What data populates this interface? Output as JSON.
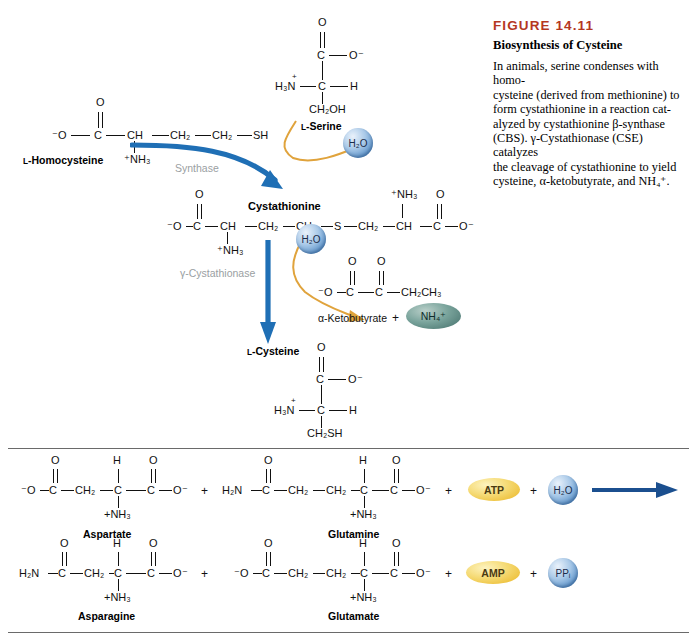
{
  "figure": {
    "number": "FIGURE 14.11",
    "title": "Biosynthesis of Cysteine",
    "body_line1": "In animals, serine condenses with homo-",
    "body_line2": "cysteine (derived from methionine) to",
    "body_line3": "form cystathionine in a reaction cat-",
    "body_line4": "alyzed by cystathionine β-synthase",
    "body_line5": "(CBS). γ-Cystathionase (CSE) catalyzes",
    "body_line6": "the cleavage of cystathionine to yield",
    "body_line7": "cysteine, α-ketobutyrate, and NH₄⁺.",
    "accent_color": "#b5371f"
  },
  "colors": {
    "blue_arrow": "#1f6fb5",
    "orange_arrow": "#e0a33c",
    "enzyme_label": "#9aa0a2",
    "water_bubble": "#5b92c9",
    "atp_oval": "#eec23f",
    "ammonium_oval": "#547f79",
    "rule": "#6a6a6a"
  },
  "panel_top": {
    "homocysteine": {
      "label": "L-Homocysteine",
      "label_smallcaps": "L",
      "label_rest": "-Homocysteine",
      "atoms": {
        "o_minus": "⁻O",
        "c": "C",
        "o_double": "O",
        "ch": "CH",
        "ch2_a": "CH₂",
        "ch2_b": "CH₂",
        "sh": "SH",
        "nh3": "⁺NH₃"
      }
    },
    "serine": {
      "label": "L-Serine",
      "label_smallcaps": "L",
      "label_rest": "-Serine",
      "atoms": {
        "o_double": "O",
        "c_top": "C",
        "o_minus": "O⁻",
        "h3n": "H₃N",
        "h3n_charge": "+",
        "c_alpha": "C",
        "h": "H",
        "ch2oh": "CH₂OH"
      }
    },
    "enzyme_synthase": "Synthase",
    "water_1": "H₂O",
    "cystathionine": {
      "label": "Cystathionine",
      "atoms": {
        "o_minus_left": "⁻O",
        "c_left": "C",
        "o_double_left": "O",
        "ch_left": "CH",
        "nh3_left": "⁺NH₃",
        "ch2_a": "CH₂",
        "ch2_b": "CH₂",
        "s": "S",
        "ch2_c": "CH₂",
        "ch_right": "CH",
        "nh3_right": "⁺NH₃",
        "c_right": "C",
        "o_double_right": "O",
        "o_minus_right": "O⁻"
      }
    },
    "enzyme_cystathionase": "γ-Cystathionase",
    "water_2": "H₂O",
    "ketobutyrate": {
      "label": "α-Ketobutyrate",
      "plus": "+",
      "ammonium": "NH₄⁺",
      "atoms": {
        "o_minus": "⁻O",
        "c1": "C",
        "o1": "O",
        "c2": "C",
        "o2": "O",
        "ch2ch3": "CH₂CH₃"
      }
    },
    "cysteine": {
      "label": "L-Cysteine",
      "label_smallcaps": "L",
      "label_rest": "-Cysteine",
      "atoms": {
        "o_double": "O",
        "c_top": "C",
        "o_minus": "O⁻",
        "h3n": "H₃N",
        "h3n_charge": "+",
        "c_alpha": "C",
        "h": "H",
        "ch2sh": "CH₂SH"
      }
    }
  },
  "panel_bottom": {
    "row1": {
      "aspartate": {
        "label": "Aspartate",
        "atoms": {
          "o_minus_left": "⁻O",
          "c1": "C",
          "o1": "O",
          "ch2": "CH₂",
          "c_alpha": "C",
          "h": "H",
          "nh3": "+NH₃",
          "c2": "C",
          "o2": "O",
          "o_minus_right": "O⁻"
        }
      },
      "plus_1": "+",
      "glutamine": {
        "label": "Glutamine",
        "atoms": {
          "h2n": "H₂N",
          "c1": "C",
          "o1": "O",
          "ch2_a": "CH₂",
          "ch2_b": "CH₂",
          "c_alpha": "C",
          "h": "H",
          "nh3": "+NH₃",
          "c2": "C",
          "o2": "O",
          "o_minus": "O⁻"
        }
      },
      "plus_2": "+",
      "atp": "ATP",
      "plus_3": "+",
      "water": "H₂O"
    },
    "row2": {
      "asparagine": {
        "label": "Asparagine",
        "atoms": {
          "h2n": "H₂N",
          "c1": "C",
          "o1": "O",
          "ch2": "CH₂",
          "c_alpha": "C",
          "h": "H",
          "nh3": "+NH₃",
          "c2": "C",
          "o2": "O",
          "o_minus": "O⁻"
        }
      },
      "plus_1": "+",
      "glutamate": {
        "label": "Glutamate",
        "atoms": {
          "o_minus_left": "⁻O",
          "c1": "C",
          "o1": "O",
          "ch2_a": "CH₂",
          "ch2_b": "CH₂",
          "c_alpha": "C",
          "h": "H",
          "nh3": "+NH₃",
          "c2": "C",
          "o2": "O",
          "o_minus_right": "O⁻"
        }
      },
      "plus_2": "+",
      "amp": "AMP",
      "plus_3": "+",
      "ppi": "PPᵢ"
    }
  }
}
